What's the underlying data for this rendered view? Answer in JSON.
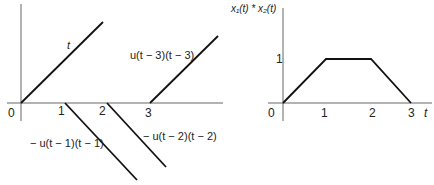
{
  "left_plot": {
    "origin_label": "0",
    "tick_labels": [
      "1",
      "2",
      "3"
    ],
    "curves": [
      {
        "label": "t",
        "from": [
          0,
          0
        ],
        "to": [
          2,
          2
        ]
      },
      {
        "label": "u(t − 3)(t − 3)",
        "from": [
          3,
          0
        ],
        "to": [
          4.6,
          1.6
        ]
      },
      {
        "label": "− u(t − 1)(t − 1)",
        "from": [
          1,
          0
        ],
        "to": [
          2.7,
          -1.8
        ]
      },
      {
        "label": "− u(t − 2)(t − 2)",
        "from": [
          2,
          0
        ],
        "to": [
          3.4,
          -1.5
        ]
      }
    ]
  },
  "right_plot": {
    "y_axis_label": "x₁(t) * x₂(t)",
    "x_axis_label": "t",
    "origin_label": "0",
    "x_tick_labels": [
      "1",
      "2",
      "3"
    ],
    "y_tick_labels": [
      "1"
    ],
    "points": [
      [
        0,
        0
      ],
      [
        1,
        1
      ],
      [
        2,
        1
      ],
      [
        3,
        0
      ]
    ]
  },
  "colors": {
    "line": "#111111",
    "axis": "#555555"
  }
}
